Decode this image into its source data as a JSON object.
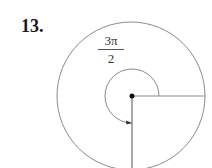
{
  "problem": {
    "number": "13."
  },
  "angle_label": {
    "numerator": "3π",
    "denominator": "2"
  },
  "figure": {
    "type": "unit-circle-angle",
    "angle_radians": "3π/2",
    "direction": "counterclockwise",
    "initial_side": "positive x-axis",
    "terminal_side": "negative y-axis",
    "stroke_color": "#8a8a8a",
    "dot_color": "#111111"
  }
}
